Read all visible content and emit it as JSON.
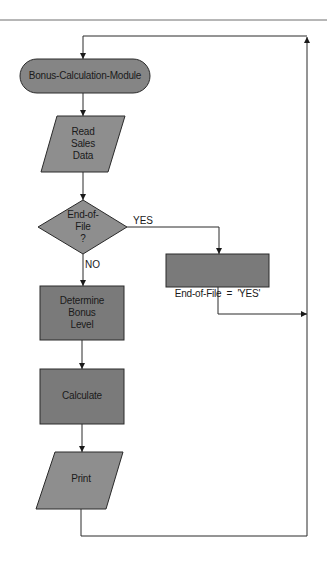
{
  "diagram": {
    "type": "flowchart",
    "colors": {
      "line": "#2a2a2a",
      "top_rule": "#6e6e6e",
      "terminal_fill": "#858585",
      "io_fill": "#8e8e8e",
      "decision_fill": "#8e8e8e",
      "process_fill": "#7a7a7a",
      "text": "#1a1a1a"
    },
    "nodes": {
      "start": {
        "shape": "terminal",
        "label": "Bonus-Calculation-Module"
      },
      "read": {
        "shape": "parallelogram",
        "lines": [
          "Read",
          "Sales",
          "Data"
        ]
      },
      "decision": {
        "shape": "diamond",
        "lines": [
          "End-of-",
          "File",
          "?"
        ]
      },
      "set_eof": {
        "shape": "rectangle",
        "label": "End-of-File  =  'YES'"
      },
      "determine": {
        "shape": "rectangle",
        "lines": [
          "Determine",
          "Bonus",
          "Level"
        ]
      },
      "calculate": {
        "shape": "rectangle",
        "label": "Calculate"
      },
      "print": {
        "shape": "parallelogram",
        "label": "Print"
      }
    },
    "edge_labels": {
      "yes": "YES",
      "no": "NO"
    },
    "edges": [
      {
        "from": "start",
        "to": "read"
      },
      {
        "from": "read",
        "to": "decision"
      },
      {
        "from": "decision",
        "to": "set_eof",
        "label": "YES"
      },
      {
        "from": "decision",
        "to": "determine",
        "label": "NO"
      },
      {
        "from": "set_eof",
        "to": "loop-return"
      },
      {
        "from": "determine",
        "to": "calculate"
      },
      {
        "from": "calculate",
        "to": "print"
      },
      {
        "from": "print",
        "to": "loop-return"
      },
      {
        "from": "loop-return",
        "to": "start"
      }
    ]
  }
}
